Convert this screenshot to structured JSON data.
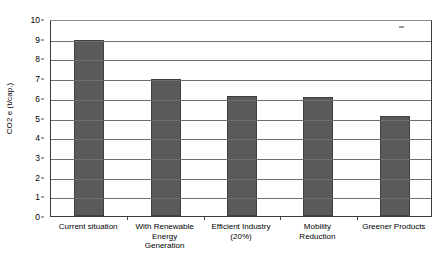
{
  "chart_data": {
    "type": "bar",
    "title": "",
    "subtitle": "",
    "xlabel": "",
    "ylabel": "CO2 e (t/cap.)",
    "ylim": [
      0,
      10
    ],
    "ytick_step": 1,
    "yticks": [
      "0",
      "1",
      "2",
      "3",
      "4",
      "5",
      "6",
      "7",
      "8",
      "9",
      "10"
    ],
    "grid": true,
    "grid_axis": "y",
    "legend": false,
    "legend_position": "none",
    "categories": [
      "Current situation",
      "With Renewable Energy Generation",
      "Efficient Industry (20%)",
      "Mobility Reduction",
      "Greener Products"
    ],
    "category_lines": [
      [
        "Current situation"
      ],
      [
        "With Renewable",
        "Energy",
        "Generation"
      ],
      [
        "Efficient Industry",
        "(20%)"
      ],
      [
        "Mobility",
        "Reduction"
      ],
      [
        "Greener Products"
      ]
    ],
    "values": [
      8.95,
      6.95,
      6.1,
      6.05,
      5.1
    ],
    "series": [
      {
        "name": "CO2 e per capita",
        "values": [
          8.95,
          6.95,
          6.1,
          6.05,
          5.1
        ]
      }
    ],
    "bar_color": "#5a5a5a",
    "bar_edge_color": "#3f3f3f",
    "axis_color": "#3c3c3c",
    "gridline_color": "#6e6e6e",
    "background_color": "#ffffff"
  }
}
